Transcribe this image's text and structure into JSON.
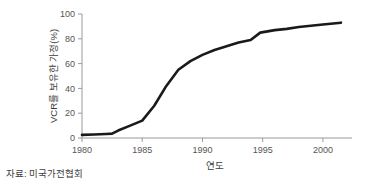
{
  "chart_data": {
    "type": "line",
    "title": "",
    "subtitle": "",
    "xlabel": "연도",
    "ylabel": "VCR를 보유한 가정(%)",
    "xlim": [
      1980,
      2002
    ],
    "ylim": [
      0,
      100
    ],
    "grid": false,
    "legend": "none",
    "line_color": "#1a1a1a",
    "axis_color": "#9a9a9a",
    "xticks": [
      1980,
      1985,
      1990,
      1995,
      2000
    ],
    "xtick_labels": [
      "1980",
      "1985",
      "1990",
      "1995",
      "2000"
    ],
    "yticks": [
      0,
      20,
      40,
      60,
      80,
      100
    ],
    "ytick_labels": [
      "0",
      "20",
      "40",
      "60",
      "80",
      "100"
    ],
    "x": [
      1980,
      1981,
      1982,
      1982.5,
      1983,
      1984,
      1985,
      1986,
      1987,
      1988,
      1989,
      1990,
      1991,
      1992,
      1993,
      1994,
      1994.8,
      1996,
      1997,
      1998,
      1999,
      2000,
      2001.5
    ],
    "values": [
      2.5,
      2.8,
      3.2,
      3.5,
      6,
      10,
      14,
      26,
      42,
      55,
      62,
      67,
      71,
      74,
      77,
      79,
      85,
      87,
      88,
      89.5,
      90.5,
      91.5,
      93
    ],
    "series": [
      {
        "name": "VCR를 보유한 가정(%)",
        "values": [
          2.5,
          2.8,
          3.2,
          3.5,
          6,
          10,
          14,
          26,
          42,
          55,
          62,
          67,
          71,
          74,
          77,
          79,
          85,
          87,
          88,
          89.5,
          90.5,
          91.5,
          93
        ]
      }
    ],
    "annotations": []
  },
  "source": {
    "text": "자료: 미국가전협회"
  }
}
